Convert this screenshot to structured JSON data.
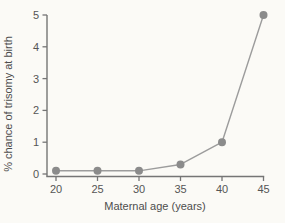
{
  "chart_data": {
    "type": "line",
    "title": "",
    "xlabel": "Maternal age (years)",
    "ylabel": "% chance of trisomy at birth",
    "x": [
      20,
      25,
      30,
      35,
      40,
      45
    ],
    "series": [
      {
        "name": "% chance of trisomy at birth",
        "values": [
          0.1,
          0.1,
          0.1,
          0.3,
          1,
          5
        ]
      }
    ],
    "xlim": [
      20,
      45
    ],
    "ylim": [
      0,
      5
    ],
    "x_ticks": [
      20,
      25,
      30,
      35,
      40,
      45
    ],
    "y_ticks": [
      0,
      1,
      2,
      3,
      4,
      5
    ],
    "grid": false,
    "legend": false,
    "colors": {
      "background": "#fbfaf6",
      "line": "#9c9c9c",
      "marker": "#8b8b8b",
      "axis": "#757575",
      "text": "#4d4d4d",
      "tick_text": "#555555"
    }
  }
}
